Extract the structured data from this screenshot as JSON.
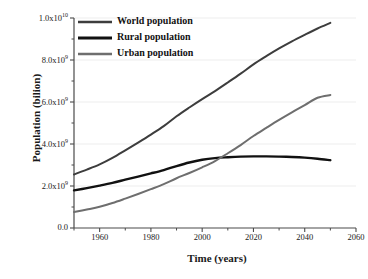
{
  "chart_data": {
    "type": "line",
    "title": "",
    "xlabel": "Time (years)",
    "ylabel": "Population (bilion)",
    "xlim": [
      1950,
      2060
    ],
    "ylim": [
      0,
      10000000000
    ],
    "grid": true,
    "legend_position": "top-left",
    "x_ticks": [
      1960,
      1980,
      2000,
      2020,
      2040,
      2060
    ],
    "x_tick_labels": [
      "1960",
      "1980",
      "2000",
      "2020",
      "2040",
      "2060"
    ],
    "y_ticks": [
      0,
      2000000000,
      4000000000,
      6000000000,
      8000000000,
      10000000000
    ],
    "y_tick_labels": [
      "0.0",
      "2.0x10⁹",
      "4.0x10⁹",
      "6.0x10⁹",
      "8.0x10⁹",
      "1.0x10¹⁰"
    ],
    "x": [
      1950,
      1955,
      1960,
      1965,
      1970,
      1975,
      1980,
      1985,
      1990,
      1995,
      2000,
      2005,
      2010,
      2015,
      2020,
      2025,
      2030,
      2035,
      2040,
      2045,
      2050
    ],
    "series": [
      {
        "name": "World population",
        "color": "#3d3d3d",
        "width": 2.0,
        "values": [
          2550000000,
          2780000000,
          3030000000,
          3340000000,
          3700000000,
          4070000000,
          4450000000,
          4850000000,
          5320000000,
          5740000000,
          6140000000,
          6520000000,
          6930000000,
          7350000000,
          7790000000,
          8180000000,
          8550000000,
          8890000000,
          9200000000,
          9500000000,
          9770000000
        ]
      },
      {
        "name": "Rural population",
        "color": "#111111",
        "width": 2.4,
        "values": [
          1790000000,
          1900000000,
          2020000000,
          2150000000,
          2300000000,
          2450000000,
          2600000000,
          2760000000,
          2950000000,
          3120000000,
          3250000000,
          3330000000,
          3370000000,
          3400000000,
          3410000000,
          3410000000,
          3400000000,
          3380000000,
          3350000000,
          3300000000,
          3230000000
        ]
      },
      {
        "name": "Urban population",
        "color": "#6e6e6e",
        "width": 2.0,
        "values": [
          760000000,
          880000000,
          1010000000,
          1190000000,
          1400000000,
          1620000000,
          1850000000,
          2090000000,
          2370000000,
          2620000000,
          2890000000,
          3190000000,
          3560000000,
          3950000000,
          4380000000,
          4770000000,
          5150000000,
          5510000000,
          5850000000,
          6200000000,
          6330000000
        ]
      }
    ],
    "annotations": {
      "rural_urban_crossover_year": 2007
    }
  }
}
